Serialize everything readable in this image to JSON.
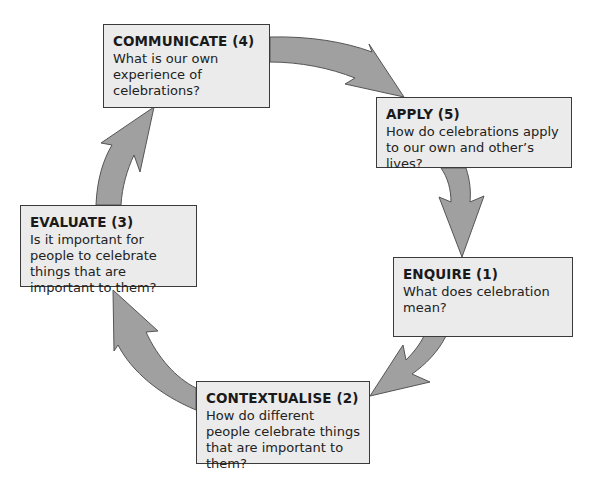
{
  "diagram": {
    "type": "cycle",
    "colors": {
      "arrow_fill": "#a0a0a0",
      "arrow_stroke": "#555555",
      "box_fill": "#ebebeb",
      "box_border": "#3a3a3a"
    },
    "stages": {
      "communicate": {
        "title": "COMMUNICATE (4)",
        "body": "What is our own experience of celebrations?"
      },
      "apply": {
        "title": "APPLY (5)",
        "body": "How do celebrations apply to our own and other’s lives?"
      },
      "enquire": {
        "title": "ENQUIRE (1)",
        "body": "What does celebration mean?"
      },
      "contextualise": {
        "title": "CONTEXTUALISE (2)",
        "body": "How do different people celebrate things that are important to them?"
      },
      "evaluate": {
        "title": "EVALUATE (3)",
        "body": "Is it important for people to celebrate things that are important to them?"
      }
    },
    "flow": [
      "ENQUIRE (1) -> CONTEXTUALISE (2)",
      "CONTEXTUALISE (2) -> EVALUATE (3)",
      "EVALUATE (3) -> COMMUNICATE (4)",
      "COMMUNICATE (4) -> APPLY (5)",
      "APPLY (5) -> ENQUIRE (1)"
    ]
  }
}
